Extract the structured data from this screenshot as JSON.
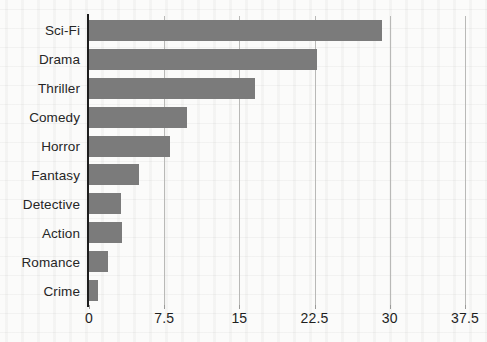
{
  "chart_data": {
    "type": "bar",
    "orientation": "horizontal",
    "title": "",
    "xlabel": "",
    "ylabel": "",
    "categories": [
      "Sci-Fi",
      "Drama",
      "Thriller",
      "Comedy",
      "Horror",
      "Fantasy",
      "Detective",
      "Action",
      "Romance",
      "Crime"
    ],
    "values": [
      29.2,
      22.7,
      16.6,
      9.8,
      8.1,
      5.0,
      3.2,
      3.3,
      1.9,
      0.9
    ],
    "xlim": [
      0,
      39.5
    ],
    "xticks": [
      0,
      7.5,
      15,
      22.5,
      30,
      37.5
    ],
    "xticklabels": [
      "0",
      "7.5",
      "15",
      "22.5",
      "30",
      "37.5"
    ],
    "grid": "vertical",
    "legend": "none",
    "bar_color": "#7b7b7b",
    "axis_color": "#1d1d1d",
    "gridline_color": "#b9b9b7",
    "background_color": "#fbfbfa"
  }
}
